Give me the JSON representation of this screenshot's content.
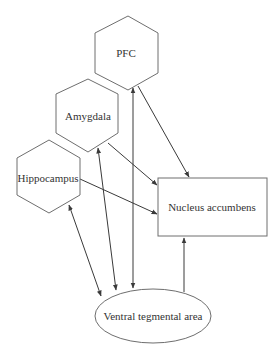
{
  "diagram": {
    "type": "brain-circuit",
    "nodes": [
      {
        "id": "pfc",
        "label": "PFC",
        "shape": "hexagon"
      },
      {
        "id": "amygdala",
        "label": "Amygdala",
        "shape": "hexagon"
      },
      {
        "id": "hippocampus",
        "label": "Hippocampus",
        "shape": "hexagon"
      },
      {
        "id": "nac",
        "label": "Nucleus accumbens",
        "shape": "rectangle"
      },
      {
        "id": "vta",
        "label": "Ventral tegmental area",
        "shape": "ellipse"
      }
    ],
    "edges": [
      {
        "from": "pfc",
        "to": "nac",
        "direction": "forward"
      },
      {
        "from": "amygdala",
        "to": "nac",
        "direction": "forward"
      },
      {
        "from": "hippocampus",
        "to": "nac",
        "direction": "forward"
      },
      {
        "from": "vta",
        "to": "nac",
        "direction": "forward"
      },
      {
        "from": "vta",
        "to": "pfc",
        "direction": "bidirectional"
      },
      {
        "from": "vta",
        "to": "amygdala",
        "direction": "bidirectional"
      },
      {
        "from": "vta",
        "to": "hippocampus",
        "direction": "bidirectional"
      }
    ],
    "colors": {
      "stroke": "#6e6e6e",
      "edge": "#3a3a3a",
      "text": "#333333"
    }
  }
}
